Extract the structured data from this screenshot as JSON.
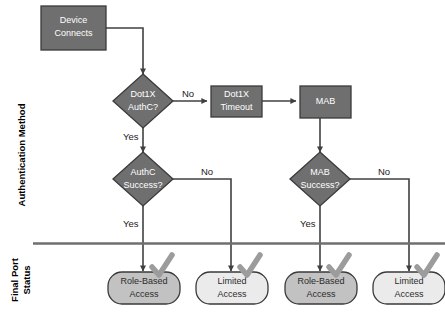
{
  "diagram": {
    "colors": {
      "node_fill_dark": "#6f6f6f",
      "node_fill_mid": "#8a8a8a",
      "node_fill_light": "#d8d8d8",
      "node_stroke": "#3a3a3a",
      "line": "#404040",
      "check": "#9a9a9a",
      "lane_divider": "#6f6f6f",
      "text_light": "#ffffff",
      "text_dark": "#2b2b2b"
    },
    "lanes": [
      {
        "id": "lane-authentication-method",
        "label": "Authentication Method"
      },
      {
        "id": "lane-final-port-status",
        "label_line1": "Final Port",
        "label_line2": "Status"
      }
    ],
    "nodes": [
      {
        "id": "device-connects",
        "shape": "process",
        "label_line1": "Device",
        "label_line2": "Connects"
      },
      {
        "id": "dot1x-authc",
        "shape": "decision",
        "label_line1": "Dot1X",
        "label_line2": "AuthC?"
      },
      {
        "id": "dot1x-timeout",
        "shape": "process",
        "label_line1": "Dot1X",
        "label_line2": "Timeout"
      },
      {
        "id": "mab",
        "shape": "process",
        "label_line1": "MAB",
        "label_line2": ""
      },
      {
        "id": "authc-success",
        "shape": "decision",
        "label_line1": "AuthC",
        "label_line2": "Success?"
      },
      {
        "id": "mab-success",
        "shape": "decision",
        "label_line1": "MAB",
        "label_line2": "Success?"
      },
      {
        "id": "terminal-role-based-access-1",
        "shape": "terminator",
        "label_line1": "Role-Based",
        "label_line2": "Access"
      },
      {
        "id": "terminal-limited-access-1",
        "shape": "terminator",
        "label_line1": "Limited",
        "label_line2": "Access"
      },
      {
        "id": "terminal-role-based-access-2",
        "shape": "terminator",
        "label_line1": "Role-Based",
        "label_line2": "Access"
      },
      {
        "id": "terminal-limited-access-2",
        "shape": "terminator",
        "label_line1": "Limited",
        "label_line2": "Access"
      }
    ],
    "edge_labels": {
      "dot1x_no": "No",
      "dot1x_yes": "Yes",
      "authc_no": "No",
      "authc_yes": "Yes",
      "mab_no": "No",
      "mab_yes": "Yes"
    }
  }
}
